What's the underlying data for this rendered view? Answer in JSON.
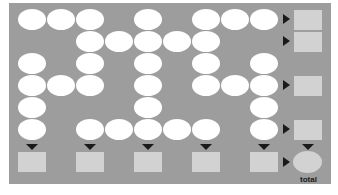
{
  "title": "",
  "colors": {
    "panel": "#9d9d9d",
    "oval": "#ffffff",
    "answer_box": "#d2d2d2",
    "arrow": "#1a1a1a"
  },
  "grid": {
    "columns": 9,
    "rows": 6,
    "filled": [
      [
        0,
        1,
        2,
        4,
        6,
        7,
        8
      ],
      [
        2,
        3,
        4,
        5,
        6
      ],
      [
        0,
        2,
        4,
        6,
        8
      ],
      [
        0,
        1,
        2,
        4,
        6,
        7,
        8
      ],
      [
        0,
        4,
        8
      ],
      [
        0,
        2,
        3,
        4,
        5,
        6,
        8
      ]
    ]
  },
  "row_sum_boxes": [
    0,
    1,
    3,
    5
  ],
  "column_sum_boxes": [
    0,
    2,
    4,
    6,
    8
  ],
  "total": {
    "label": "total"
  }
}
